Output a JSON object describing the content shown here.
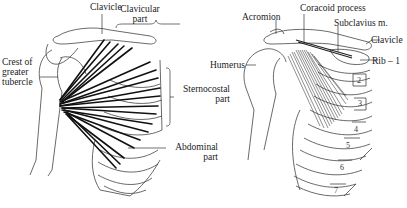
{
  "figure": {
    "left_panel": {
      "subject": "pectoralis major",
      "labels": {
        "clavicle": "Clavicle",
        "clavicular_part_1": "Clavicular",
        "clavicular_part_2": "part",
        "crest_1": "Crest of",
        "crest_2": "greater",
        "crest_3": "tubercle",
        "sternocostal_1": "Sternocostal",
        "sternocostal_2": "part",
        "abdominal_1": "Abdominal",
        "abdominal_2": "part"
      }
    },
    "right_panel": {
      "subject": "pectoralis minor and subclavius",
      "labels": {
        "acromion": "Acromion",
        "coracoid": "Coracoid process",
        "subclavius": "Subclavius m.",
        "clavicle": "Clavicle",
        "rib1": "Rib – 1",
        "humerus": "Humerus"
      },
      "rib_numbers": [
        "2",
        "3",
        "4",
        "5",
        "6",
        "7"
      ]
    },
    "colors": {
      "line": "#333333",
      "muscle": "#111111",
      "background": "#ffffff"
    }
  }
}
